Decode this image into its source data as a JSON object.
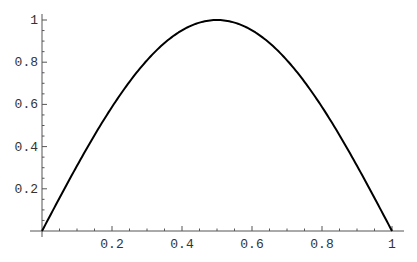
{
  "chart_data": {
    "type": "line",
    "title": "",
    "xlabel": "",
    "ylabel": "",
    "xlim": [
      0,
      1
    ],
    "ylim": [
      0,
      1
    ],
    "grid": false,
    "legend": null,
    "x_ticks": [
      0.2,
      0.4,
      0.6,
      0.8,
      1
    ],
    "x_tick_labels": [
      "0.2",
      "0.4",
      "0.6",
      "0.8",
      "1"
    ],
    "y_ticks": [
      0.2,
      0.4,
      0.6,
      0.8,
      1
    ],
    "y_tick_labels": [
      "0.2",
      "0.4",
      "0.6",
      "0.8",
      "1"
    ],
    "series": [
      {
        "name": "sin(pi x)",
        "x": [
          0,
          0.05,
          0.1,
          0.15,
          0.2,
          0.25,
          0.3,
          0.35,
          0.4,
          0.45,
          0.5,
          0.55,
          0.6,
          0.65,
          0.7,
          0.75,
          0.8,
          0.85,
          0.9,
          0.95,
          1
        ],
        "y": [
          0,
          0.156,
          0.309,
          0.454,
          0.588,
          0.707,
          0.809,
          0.891,
          0.951,
          0.988,
          1,
          0.988,
          0.951,
          0.891,
          0.809,
          0.707,
          0.588,
          0.454,
          0.309,
          0.156,
          0
        ],
        "color": "#000000"
      }
    ]
  },
  "layout": {
    "origin_px": [
      42,
      231
    ],
    "x_end_px": 392,
    "y_top_px": 20,
    "x_axis_extent_px": [
      30,
      404
    ],
    "y_axis_extent_px": [
      237,
      14
    ]
  }
}
